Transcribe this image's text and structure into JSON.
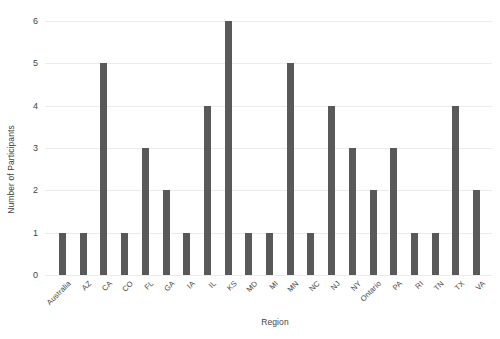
{
  "chart_data": {
    "type": "bar",
    "title": "",
    "subtitle": "",
    "xlabel": "Region",
    "ylabel": "Number of Participants",
    "categories": [
      "Australia",
      "AZ",
      "CA",
      "CO",
      "FL",
      "GA",
      "IA",
      "IL",
      "KS",
      "MD",
      "MI",
      "MN",
      "NC",
      "NJ",
      "NY",
      "Ontario",
      "PA",
      "RI",
      "TN",
      "TX",
      "VA"
    ],
    "values": [
      1,
      1,
      5,
      1,
      3,
      2,
      1,
      4,
      6,
      1,
      1,
      5,
      1,
      4,
      3,
      2,
      3,
      1,
      1,
      4,
      2
    ],
    "ylim": [
      0,
      6
    ],
    "yticks": [
      0,
      1,
      2,
      3,
      4,
      5,
      6
    ],
    "ytick_labels": [
      "0",
      "1",
      "2",
      "3",
      "4",
      "5",
      "6"
    ],
    "grid": true,
    "grid_axis": "y",
    "legend": false,
    "legend_position": "none",
    "bar_color": "#595959",
    "grid_color": "#ebebeb",
    "text_color": "#3f3f3f",
    "background_color": "#ffffff",
    "xtick_rotation": -45
  }
}
